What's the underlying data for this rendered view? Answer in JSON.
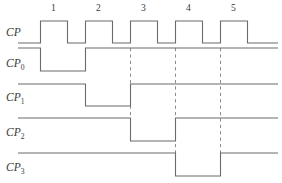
{
  "figure": {
    "kind": "timing-diagram",
    "title": "",
    "background_color": "#ffffff",
    "line_color": "#6b6b6b",
    "dash_color": "#8d8d8d",
    "text_color": "#3a3a3a"
  },
  "cycle_markers": {
    "labels": [
      "1",
      "2",
      "3",
      "4",
      "5"
    ],
    "x_centers": [
      53.5,
      98.5,
      143.5,
      188.5,
      233.5
    ],
    "y": 11
  },
  "signals": [
    {
      "id": "cp",
      "label_base": "CP",
      "label_sub": "",
      "label_x": 6,
      "label_y": 36,
      "low_y": 43,
      "high_y": 21,
      "start_x": 18,
      "end_x": 278,
      "initial_level": "low",
      "transitions_x": [
        40.5,
        67.5,
        85.5,
        112.5,
        130.5,
        157.5,
        175.5,
        202.5,
        220.5,
        247.5
      ],
      "description": "master clock, five positive pulses"
    },
    {
      "id": "cp0",
      "label_base": "CP",
      "label_sub": "0",
      "label_x": 6,
      "label_y": 67,
      "low_y": 71,
      "high_y": 48,
      "start_x": 18,
      "end_x": 278,
      "initial_level": "high",
      "transitions_x": [
        40.5,
        85.5
      ],
      "description": "divide-by-two output, goes low on first clock rising edge"
    },
    {
      "id": "cp1",
      "label_base": "CP",
      "label_sub": "1",
      "label_x": 6,
      "label_y": 101,
      "low_y": 106,
      "high_y": 84,
      "start_x": 18,
      "end_x": 278,
      "initial_level": "high",
      "transitions_x": [
        85.5,
        130.5
      ],
      "description": "goes low on second clock rising edge"
    },
    {
      "id": "cp2",
      "label_base": "CP",
      "label_sub": "2",
      "label_x": 6,
      "label_y": 136,
      "low_y": 141,
      "high_y": 118,
      "start_x": 18,
      "end_x": 278,
      "initial_level": "high",
      "transitions_x": [
        130.5,
        175.5
      ],
      "description": "goes low on third clock rising edge"
    },
    {
      "id": "cp3",
      "label_base": "CP",
      "label_sub": "3",
      "label_x": 6,
      "label_y": 171,
      "low_y": 176,
      "high_y": 153,
      "start_x": 18,
      "end_x": 278,
      "initial_level": "high",
      "transitions_x": [
        175.5,
        220.5
      ],
      "description": "goes low on fourth clock rising edge"
    }
  ],
  "dashed_guides": [
    {
      "x": 130.5,
      "y_top": 48,
      "y_bottom": 141
    },
    {
      "x": 175.5,
      "y_top": 48,
      "y_bottom": 176
    },
    {
      "x": 220.5,
      "y_top": 48,
      "y_bottom": 176
    }
  ]
}
